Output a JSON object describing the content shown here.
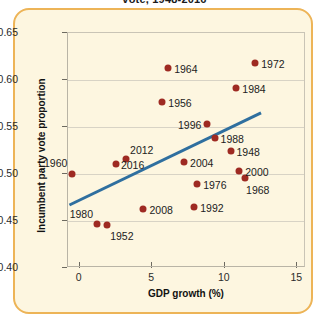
{
  "title": "vote, 1948-2016",
  "axes": {
    "xlabel": "GDP growth (%)",
    "ylabel": "Incumbent party vote proportion",
    "xticks": [
      "0",
      "5",
      "10",
      "15"
    ],
    "yticks": [
      "0.40",
      "0.45",
      "0.50",
      "0.55",
      "0.60",
      "0.65"
    ]
  },
  "colors": {
    "point": "#9e2a22",
    "trend": "#2f6f9f",
    "card_bg": "#fdf6e0",
    "card_border": "#edb457",
    "grid": "#d8d3c5"
  },
  "chart_data": {
    "type": "scatter",
    "title": "vote, 1948-2016",
    "xlabel": "GDP growth (%)",
    "ylabel": "Incumbent party vote proportion",
    "xlim": [
      -0.8,
      15.6
    ],
    "ylim": [
      0.4,
      0.65
    ],
    "grid": true,
    "legend": null,
    "point_label_key": "year",
    "points": [
      {
        "year": "1948",
        "x": 10.4,
        "y": 0.524
      },
      {
        "year": "1952",
        "x": 1.9,
        "y": 0.446
      },
      {
        "year": "1956",
        "x": 5.7,
        "y": 0.577
      },
      {
        "year": "1960",
        "x": -0.5,
        "y": 0.5
      },
      {
        "year": "1964",
        "x": 6.1,
        "y": 0.613
      },
      {
        "year": "1968",
        "x": 11.4,
        "y": 0.496
      },
      {
        "year": "1972",
        "x": 12.1,
        "y": 0.618
      },
      {
        "year": "1976",
        "x": 8.1,
        "y": 0.489
      },
      {
        "year": "1980",
        "x": 1.2,
        "y": 0.447
      },
      {
        "year": "1984",
        "x": 10.8,
        "y": 0.592
      },
      {
        "year": "1988",
        "x": 9.3,
        "y": 0.538
      },
      {
        "year": "1992",
        "x": 7.9,
        "y": 0.465
      },
      {
        "year": "1996",
        "x": 8.8,
        "y": 0.553
      },
      {
        "year": "2000",
        "x": 11.0,
        "y": 0.503
      },
      {
        "year": "2004",
        "x": 7.2,
        "y": 0.513
      },
      {
        "year": "2008",
        "x": 4.4,
        "y": 0.463
      },
      {
        "year": "2012",
        "x": 3.2,
        "y": 0.516
      },
      {
        "year": "2016",
        "x": 2.5,
        "y": 0.511
      }
    ],
    "trendline": {
      "x0": -0.7,
      "y0": 0.467,
      "x1": 12.5,
      "y1": 0.565
    }
  }
}
